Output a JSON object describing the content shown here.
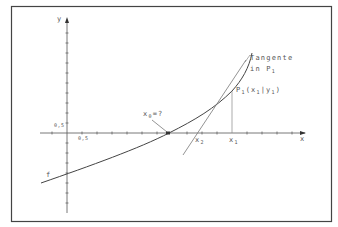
{
  "diagram": {
    "colors": {
      "frame": "#444444",
      "axis": "#555555",
      "curve": "#444444",
      "tangent": "#777777",
      "dropline": "#888888",
      "text": "#555555"
    },
    "axes": {
      "x_label": "x",
      "y_label": "y",
      "x_unit_label": "0,5",
      "y_unit_label": "0,5"
    },
    "curve": {
      "label": "f"
    },
    "start_value": {
      "label_main": "x",
      "label_sub": "0",
      "label_rest": "=?"
    },
    "tangent": {
      "line1": "Tangente",
      "line2_main": "in  P",
      "line2_sub": "1"
    },
    "point": {
      "main": "P",
      "sub": "1",
      "rest_open": "(x",
      "x_sub": "1",
      "sep": "|y",
      "y_sub": "1",
      "close": ")"
    },
    "x1": {
      "main": "x",
      "sub": "1"
    },
    "x2": {
      "main": "x",
      "sub": "2"
    }
  }
}
